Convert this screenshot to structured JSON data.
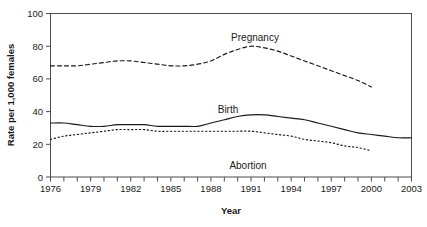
{
  "chart_data": {
    "type": "line",
    "title": "",
    "xlabel": "Year",
    "ylabel": "Rate per 1,000 females",
    "xlim": [
      1976,
      2003
    ],
    "ylim": [
      0,
      100
    ],
    "grid": false,
    "legend_position": "inline-annotations",
    "x": [
      1976,
      1977,
      1978,
      1979,
      1980,
      1981,
      1982,
      1983,
      1984,
      1985,
      1986,
      1987,
      1988,
      1989,
      1990,
      1991,
      1992,
      1993,
      1994,
      1995,
      1996,
      1997,
      1998,
      1999,
      2000,
      2001,
      2002,
      2003
    ],
    "x_tick_labels": [
      "1976",
      "1979",
      "1982",
      "1985",
      "1988",
      "1991",
      "1994",
      "1997",
      "2000",
      "2003"
    ],
    "x_tick_values": [
      1976,
      1979,
      1982,
      1985,
      1988,
      1991,
      1994,
      1997,
      2000,
      2003
    ],
    "y_tick_labels": [
      "0",
      "20",
      "40",
      "60",
      "80",
      "100"
    ],
    "y_tick_values": [
      0,
      20,
      40,
      60,
      80,
      100
    ],
    "series": [
      {
        "name": "Pregnancy",
        "style": "dashed",
        "x": [
          1976,
          1977,
          1978,
          1979,
          1980,
          1981,
          1982,
          1983,
          1984,
          1985,
          1986,
          1987,
          1988,
          1989,
          1990,
          1991,
          1992,
          1993,
          1994,
          1995,
          1996,
          1997,
          1998,
          1999,
          2000
        ],
        "values": [
          68,
          68,
          68,
          69,
          70,
          71,
          71,
          70,
          69,
          68,
          68,
          69,
          71,
          75,
          78,
          80,
          79,
          77,
          74,
          71,
          68,
          65,
          62,
          59,
          55
        ]
      },
      {
        "name": "Birth",
        "style": "solid",
        "x": [
          1976,
          1977,
          1978,
          1979,
          1980,
          1981,
          1982,
          1983,
          1984,
          1985,
          1986,
          1987,
          1988,
          1989,
          1990,
          1991,
          1992,
          1993,
          1994,
          1995,
          1996,
          1997,
          1998,
          1999,
          2000,
          2001,
          2002,
          2003
        ],
        "values": [
          33,
          33,
          32,
          31,
          31,
          32,
          32,
          32,
          31,
          31,
          31,
          31,
          33,
          35,
          37,
          38,
          38,
          37,
          36,
          35,
          33,
          31,
          29,
          27,
          26,
          25,
          24,
          24
        ]
      },
      {
        "name": "Abortion",
        "style": "dotted",
        "x": [
          1976,
          1977,
          1978,
          1979,
          1980,
          1981,
          1982,
          1983,
          1984,
          1985,
          1986,
          1987,
          1988,
          1989,
          1990,
          1991,
          1992,
          1993,
          1994,
          1995,
          1996,
          1997,
          1998,
          1999,
          2000
        ],
        "values": [
          23,
          25,
          26,
          27,
          28,
          29,
          29,
          29,
          28,
          28,
          28,
          28,
          28,
          28,
          28,
          28,
          27,
          26,
          25,
          23,
          22,
          21,
          19,
          18,
          16
        ]
      }
    ]
  },
  "annotations": {
    "pregnancy_label": "Pregnancy",
    "birth_label": "Birth",
    "abortion_label": "Abortion"
  },
  "axes": {
    "y_title": "Rate per 1,000 females",
    "x_title": "Year"
  },
  "colors": {
    "line": "#1a1a1a",
    "frame": "#4d4d4d",
    "background": "#ffffff"
  }
}
